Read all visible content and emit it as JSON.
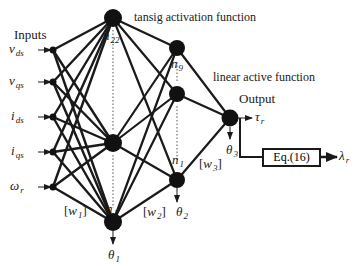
{
  "diagram": {
    "type": "neural-network-architecture",
    "labels": {
      "inputs_heading": "Inputs",
      "hidden1_activation": "tansig activation function",
      "output_activation": "linear active function",
      "output_heading": "Output",
      "equation_box": "Eq.(16)"
    },
    "inputs": [
      {
        "symbol": "v",
        "subscript": "ds"
      },
      {
        "symbol": "v",
        "subscript": "qs"
      },
      {
        "symbol": "i",
        "subscript": "ds"
      },
      {
        "symbol": "i",
        "subscript": "qs"
      },
      {
        "symbol": "ω",
        "subscript": "r"
      }
    ],
    "hidden_layer_1": {
      "top_node_label": {
        "symbol": "n",
        "subscript": "22"
      },
      "bottom_node_label": {
        "symbol": "n",
        "subscript": "1"
      },
      "bias": {
        "symbol": "θ",
        "subscript": "1"
      },
      "weights": {
        "symbol": "w",
        "subscript": "1"
      }
    },
    "hidden_layer_2": {
      "top_node_label": {
        "symbol": "n",
        "subscript": "9"
      },
      "bottom_node_label": {
        "symbol": "n",
        "subscript": "1"
      },
      "bias": {
        "symbol": "θ",
        "subscript": "2"
      },
      "weights": {
        "symbol": "w",
        "subscript": "2"
      }
    },
    "output_layer": {
      "bias": {
        "symbol": "θ",
        "subscript": "3"
      },
      "weights": {
        "symbol": "w",
        "subscript": "3"
      },
      "output": {
        "symbol": "τ",
        "subscript": "r"
      },
      "derived_output": {
        "symbol": "λ",
        "subscript": "r"
      }
    },
    "colors": {
      "line": "#1a1a1a",
      "node": "#111111",
      "background": "#ffffff"
    }
  }
}
